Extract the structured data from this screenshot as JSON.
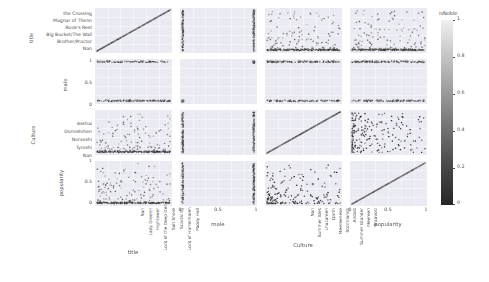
{
  "chart_data": {
    "type": "scatter",
    "title": "",
    "subtitle": "",
    "plot_kind": "scatter-plot-matrix",
    "variables": [
      "title",
      "male",
      "Culture",
      "popularity"
    ],
    "grid": true,
    "legend_position": "right",
    "colorbar": {
      "title": "isNoble",
      "ticks": [
        "1",
        "0.8",
        "0.6",
        "0.4",
        "0.2",
        "0"
      ],
      "tick_values": [
        1,
        0.8,
        0.6,
        0.4,
        0.2,
        0
      ],
      "vmin": 0,
      "vmax": 1,
      "colormap_low": "#262626",
      "colormap_high": "#f0f0f0"
    },
    "axes": {
      "title": {
        "label": "title",
        "type": "categorical",
        "y_ticks": [
          "the Crossing",
          "Magnar of Thenn",
          "Rook's Rest",
          "Big Bucket/The Wall",
          "Brother/Proctor",
          "Nan"
        ],
        "x_ticks": [
          "Nan",
          "Lady Greenn",
          "Hightower",
          "Lord of the Deep Den",
          "Salt Shore",
          "Scarsking",
          "Lord of Harrenhalen",
          "Paddy Hall"
        ]
      },
      "male": {
        "label": "male",
        "type": "numeric",
        "y_ticks": [
          "1",
          "0.5",
          "0"
        ],
        "x_ticks": [
          "0",
          "0.5",
          "1"
        ],
        "range": [
          0,
          1
        ]
      },
      "Culture": {
        "label": "Culture",
        "type": "categorical",
        "y_ticks": [
          "Asshai",
          "Dornishmen",
          "Norvoshi",
          "Tyroshi",
          "Nan"
        ],
        "x_ticks": [
          "Nan",
          "Summer Isles",
          "Lhazareen",
          "Qarth",
          "Meereenese",
          "Stormlands",
          "Andals",
          "Summer Islander",
          "Meereen",
          "Braavosi"
        ]
      },
      "popularity": {
        "label": "popularity",
        "type": "numeric",
        "y_ticks": [
          "1",
          "0.5",
          "0"
        ],
        "x_ticks": [
          "0",
          "0.5",
          "1"
        ],
        "range": [
          0,
          1
        ]
      }
    },
    "panels": [
      {
        "row": "title",
        "col": "title",
        "kind": "diagonal-line",
        "note": "perfect positive identity relation"
      },
      {
        "row": "title",
        "col": "male",
        "kind": "two-vertical-bands",
        "note": "points at male=0 and male=1"
      },
      {
        "row": "title",
        "col": "Culture",
        "kind": "scatter-sparse",
        "note": "dense band at low title values"
      },
      {
        "row": "title",
        "col": "popularity",
        "kind": "scatter-sparse",
        "note": "dense cluster at low popularity"
      },
      {
        "row": "male",
        "col": "title",
        "kind": "two-horizontal-bands"
      },
      {
        "row": "male",
        "col": "male",
        "kind": "diagonal-corners"
      },
      {
        "row": "male",
        "col": "Culture",
        "kind": "two-horizontal-bands"
      },
      {
        "row": "male",
        "col": "popularity",
        "kind": "two-horizontal-bands"
      },
      {
        "row": "Culture",
        "col": "title",
        "kind": "scatter-sparse"
      },
      {
        "row": "Culture",
        "col": "male",
        "kind": "two-vertical-bands"
      },
      {
        "row": "Culture",
        "col": "Culture",
        "kind": "diagonal-line"
      },
      {
        "row": "Culture",
        "col": "popularity",
        "kind": "scatter-dense-left"
      },
      {
        "row": "popularity",
        "col": "title",
        "kind": "scatter-sparse"
      },
      {
        "row": "popularity",
        "col": "male",
        "kind": "two-vertical-bands"
      },
      {
        "row": "popularity",
        "col": "Culture",
        "kind": "scatter-dense-bottom"
      },
      {
        "row": "popularity",
        "col": "popularity",
        "kind": "diagonal-line"
      }
    ]
  },
  "figure": {
    "panel_background": "#eaeaf2",
    "gridline_color": "#ffffff",
    "text_color": "#4d4d4d"
  }
}
